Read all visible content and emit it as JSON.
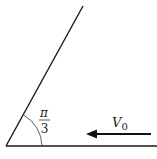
{
  "diagram": {
    "angle_label": {
      "numerator": "π",
      "denominator": "3"
    },
    "velocity_label": {
      "symbol": "V",
      "subscript": "0"
    },
    "colors": {
      "stroke": "#1a1a1a",
      "background": "#ffffff"
    }
  }
}
